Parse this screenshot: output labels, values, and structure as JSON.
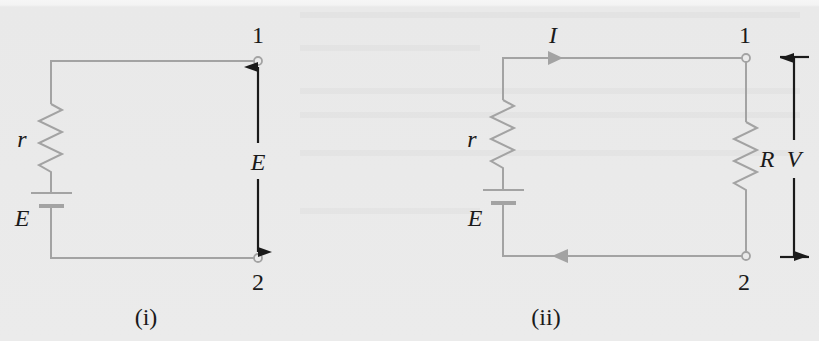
{
  "figure": {
    "colors": {
      "background": "#ebebeb",
      "wire": "#a3a3a3",
      "measurement_arrow": "#1a1a1a",
      "text": "#1a1a1a"
    },
    "panels": [
      {
        "id": "i",
        "caption": "(i)",
        "internal_resistance_label": "r",
        "emf_label": "E",
        "terminal_top_label": "1",
        "terminal_bottom_label": "2",
        "measured_quantity_label": "E"
      },
      {
        "id": "ii",
        "caption": "(ii)",
        "internal_resistance_label": "r",
        "emf_label": "E",
        "current_label": "I",
        "load_resistance_label": "R",
        "terminal_top_label": "1",
        "terminal_bottom_label": "2",
        "measured_quantity_label": "V"
      }
    ]
  }
}
